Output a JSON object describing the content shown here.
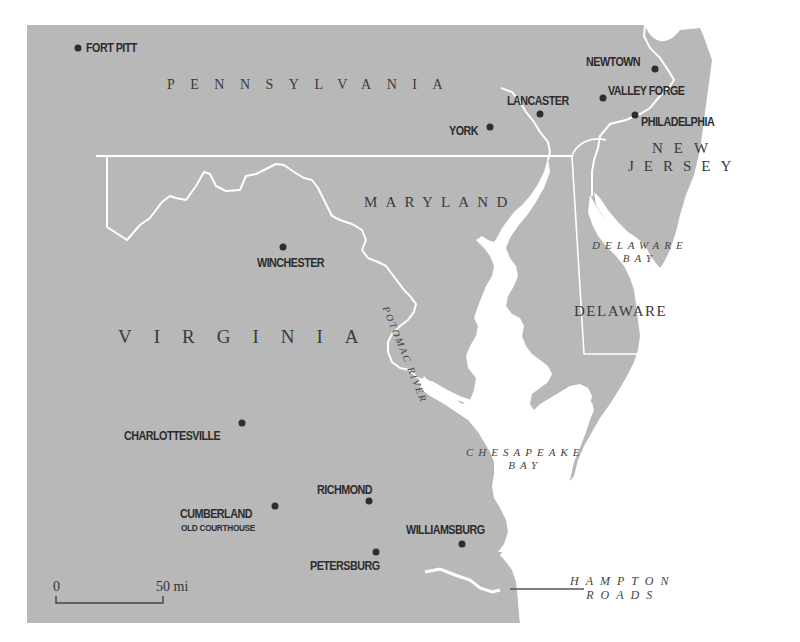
{
  "map": {
    "colors": {
      "land": "#b8b8b8",
      "water": "#ffffff",
      "border": "#ffffff",
      "city_dot": "#2e2e2e",
      "text": "#2c2c2c"
    },
    "states": [
      {
        "name": "PENNSYLVANIA"
      },
      {
        "name": "NEW"
      },
      {
        "name": "JERSEY"
      },
      {
        "name": "MARYLAND"
      },
      {
        "name": "DELAWARE"
      },
      {
        "name": "VIRGINIA"
      }
    ],
    "water": [
      {
        "line1": "DELAWARE",
        "line2": "BAY"
      },
      {
        "line1": "CHESAPEAKE",
        "line2": "BAY"
      },
      {
        "line1": "HAMPTON",
        "line2": "ROADS"
      },
      {
        "name": "POTOMAC RIVER"
      }
    ],
    "cities": [
      {
        "name": "FORT PITT"
      },
      {
        "name": "NEWTOWN"
      },
      {
        "name": "VALLEY FORGE"
      },
      {
        "name": "LANCASTER"
      },
      {
        "name": "PHILADELPHIA"
      },
      {
        "name": "YORK"
      },
      {
        "name": "WINCHESTER"
      },
      {
        "name": "CHARLOTTESVILLE"
      },
      {
        "name": "RICHMOND"
      },
      {
        "name": "CUMBERLAND",
        "sub": "OLD COURTHOUSE"
      },
      {
        "name": "WILLIAMSBURG"
      },
      {
        "name": "PETERSBURG"
      }
    ],
    "scale": {
      "start": "0",
      "end": "50 mi"
    }
  }
}
